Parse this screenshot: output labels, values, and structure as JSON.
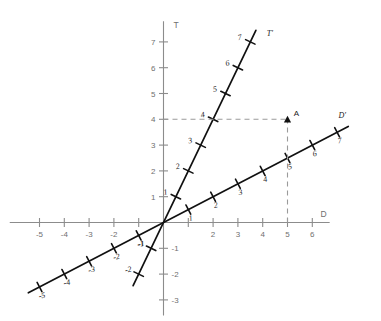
{
  "chart_data": {
    "type": "scatter",
    "title": "",
    "subtitle": "",
    "xlabel": "D",
    "ylabel": "T",
    "grid": false,
    "legend": "none",
    "xlim": [
      -6.2,
      6.7
    ],
    "ylim": [
      -3.6,
      7.8
    ],
    "axes": {
      "d": {
        "name": "D",
        "ticks": [
          -5,
          -4,
          -3,
          -2,
          -1,
          1,
          2,
          3,
          4,
          5,
          6
        ],
        "tick_labels": [
          "-5",
          "-4",
          "-3",
          "-2",
          "",
          "",
          "2",
          "3",
          "4",
          "5",
          "6"
        ]
      },
      "t": {
        "name": "T",
        "ticks": [
          7,
          6,
          5,
          4,
          3,
          2,
          1,
          -1,
          -2,
          -3
        ],
        "tick_labels": [
          "7",
          "6",
          "5",
          "4",
          "3",
          "2",
          "1",
          "-1",
          "-2",
          "-3"
        ]
      }
    },
    "series": [
      {
        "name": "D'",
        "kind": "skewed-axis",
        "label": "D'",
        "slope": 0.5,
        "ticks": [
          -5,
          -4,
          -3,
          -2,
          -1,
          1,
          2,
          3,
          4,
          5,
          6,
          7
        ],
        "tick_labels": [
          "-5",
          "-4",
          "-3",
          "-2",
          "-1",
          "1",
          "2",
          "3",
          "4",
          "5",
          "6",
          "7"
        ]
      },
      {
        "name": "T'",
        "kind": "skewed-axis",
        "label": "T'",
        "slope": 2.0,
        "ticks": [
          -2,
          -1,
          1,
          2,
          3,
          4,
          5,
          6,
          7
        ],
        "tick_labels": [
          "-2",
          "-1",
          "1",
          "2",
          "3",
          "4",
          "5",
          "6",
          "7"
        ]
      }
    ],
    "points": [
      {
        "name": "A",
        "label": "A",
        "d": 5,
        "t": 4,
        "marker": "triangle"
      }
    ],
    "annotations": [
      {
        "name": "projection-horizontal",
        "style": "dashed",
        "from": [
          0,
          4
        ],
        "to": [
          5,
          4
        ]
      },
      {
        "name": "projection-vertical",
        "style": "dashed",
        "from": [
          5,
          0
        ],
        "to": [
          5,
          4
        ]
      }
    ],
    "colors": {
      "axis": "#8c8c8c",
      "primed_axis": "#111111",
      "dashed": "#9a9a9a",
      "background": "#ffffff"
    }
  }
}
